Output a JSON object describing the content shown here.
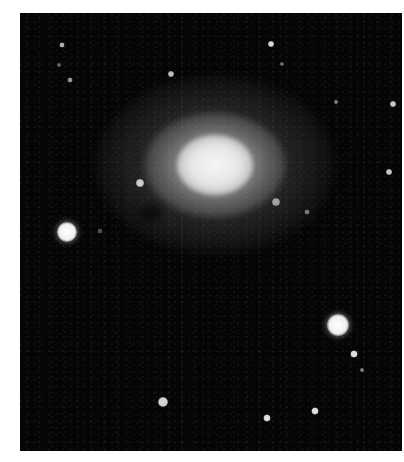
{
  "image": {
    "subject": "galaxy",
    "description": "Black-and-white telescopic photograph of a bright galaxy core with diffuse halo surrounded by field stars",
    "colors": {
      "background": "#050505",
      "border": "#ffffff",
      "core": "#f2f2f2"
    }
  },
  "galaxy": {
    "center_x": 195,
    "center_y": 152,
    "core_radius": 38,
    "halo_rx": 120,
    "halo_ry": 90
  },
  "stars": [
    {
      "x": 47,
      "y": 219,
      "r": 10,
      "b": 1.0
    },
    {
      "x": 318,
      "y": 312,
      "r": 11,
      "b": 1.0
    },
    {
      "x": 143,
      "y": 389,
      "r": 5,
      "b": 0.85
    },
    {
      "x": 247,
      "y": 405,
      "r": 3.5,
      "b": 0.9
    },
    {
      "x": 295,
      "y": 398,
      "r": 3.5,
      "b": 0.9
    },
    {
      "x": 334,
      "y": 341,
      "r": 3.5,
      "b": 0.9
    },
    {
      "x": 342,
      "y": 357,
      "r": 2,
      "b": 0.5
    },
    {
      "x": 251,
      "y": 31,
      "r": 3,
      "b": 0.85
    },
    {
      "x": 262,
      "y": 51,
      "r": 2,
      "b": 0.4
    },
    {
      "x": 151,
      "y": 61,
      "r": 3,
      "b": 0.75
    },
    {
      "x": 42,
      "y": 32,
      "r": 2.5,
      "b": 0.7
    },
    {
      "x": 39,
      "y": 52,
      "r": 2,
      "b": 0.4
    },
    {
      "x": 50,
      "y": 67,
      "r": 2.5,
      "b": 0.6
    },
    {
      "x": 373,
      "y": 91,
      "r": 3,
      "b": 0.8
    },
    {
      "x": 316,
      "y": 89,
      "r": 2,
      "b": 0.5
    },
    {
      "x": 369,
      "y": 159,
      "r": 3,
      "b": 0.8
    },
    {
      "x": 120,
      "y": 170,
      "r": 4,
      "b": 0.8
    },
    {
      "x": 256,
      "y": 189,
      "r": 4,
      "b": 0.6
    },
    {
      "x": 287,
      "y": 199,
      "r": 2.5,
      "b": 0.45
    },
    {
      "x": 80,
      "y": 218,
      "r": 2.5,
      "b": 0.3
    }
  ]
}
